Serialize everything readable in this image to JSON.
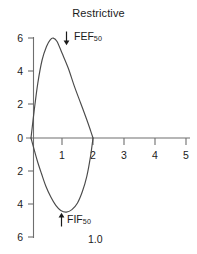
{
  "chart_data": {
    "type": "line",
    "title": "Restrictive",
    "xlabel": "",
    "ylabel": "",
    "xlim": [
      0,
      5
    ],
    "ylim": [
      -6,
      6
    ],
    "x_ticks": [
      "1",
      "2",
      "3",
      "4",
      "5"
    ],
    "x_tick_values": [
      1,
      2,
      3,
      4,
      5
    ],
    "y_ticks": [
      "6",
      "4",
      "2",
      "0",
      "2",
      "4",
      "6"
    ],
    "y_tick_values": [
      6,
      4,
      2,
      0,
      -2,
      -4,
      -6
    ],
    "grid": false,
    "legend": "none",
    "series": [
      {
        "name": "expiratory-limb",
        "comment": "Flow (L/s) vs Volume (L), expiratory above axis",
        "points": [
          [
            0.0,
            0.0
          ],
          [
            0.1,
            1.6
          ],
          [
            0.22,
            3.3
          ],
          [
            0.36,
            4.7
          ],
          [
            0.5,
            5.5
          ],
          [
            0.62,
            5.9
          ],
          [
            0.72,
            6.0
          ],
          [
            0.84,
            5.8
          ],
          [
            1.0,
            5.1
          ],
          [
            1.2,
            4.2
          ],
          [
            1.4,
            3.1
          ],
          [
            1.6,
            2.1
          ],
          [
            1.8,
            1.1
          ],
          [
            1.92,
            0.45
          ],
          [
            2.0,
            0.0
          ]
        ]
      },
      {
        "name": "inspiratory-limb",
        "comment": "Flow (L/s) vs Volume (L), inspiratory below axis",
        "points": [
          [
            2.0,
            0.0
          ],
          [
            1.92,
            -1.1
          ],
          [
            1.8,
            -2.3
          ],
          [
            1.66,
            -3.2
          ],
          [
            1.5,
            -3.9
          ],
          [
            1.32,
            -4.3
          ],
          [
            1.14,
            -4.45
          ],
          [
            0.96,
            -4.35
          ],
          [
            0.8,
            -4.05
          ],
          [
            0.64,
            -3.55
          ],
          [
            0.48,
            -2.9
          ],
          [
            0.34,
            -2.15
          ],
          [
            0.2,
            -1.35
          ],
          [
            0.08,
            -0.55
          ],
          [
            0.0,
            0.0
          ]
        ]
      }
    ],
    "annotations": [
      {
        "name": "fef50",
        "text": "FEF",
        "subscript": "50",
        "arrow": "down",
        "x": 1.1,
        "y": 5.8
      },
      {
        "name": "fif50",
        "text": "FIF",
        "subscript": "50",
        "arrow": "up",
        "x": 1.05,
        "y": -4.9
      },
      {
        "name": "volume-note",
        "text": "1.0",
        "x": 1.9,
        "y": -5.8
      }
    ]
  },
  "labels": {
    "title": "Restrictive",
    "fef_text": "FEF",
    "fef_sub": "50",
    "fif_text": "FIF",
    "fif_sub": "50",
    "volume_note": "1.0"
  },
  "colors": {
    "curve": "#4a4a4a",
    "axis": "#6e6e6e",
    "text": "#1b1b1b",
    "background": "#ffffff"
  }
}
